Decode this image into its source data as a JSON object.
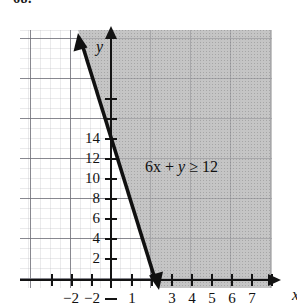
{
  "exercise": {
    "number": "68."
  },
  "chart_data": {
    "type": "line",
    "title": "",
    "subtitle": "",
    "xlabel": "x",
    "ylabel": "y",
    "inequality_label": "6x + y ≥ 12",
    "inequality": "6x + y >= 12",
    "boundary_line": {
      "equation": "y = -6x + 12",
      "slope": -6,
      "intercept": 12,
      "style": "solid",
      "arrows": "both",
      "points": [
        [
          -0.4,
          14.4
        ],
        [
          2.6,
          -3.6
        ]
      ]
    },
    "shaded_region": "right of / above boundary line (6x + y >= 12)",
    "shade_color": "#b9b9b9",
    "line_color": "#101010",
    "grid": true,
    "grid_major_step": 2,
    "grid_minor_step": 0.5,
    "xlim": [
      -3.5,
      9
    ],
    "ylim": [
      -5,
      19
    ],
    "xticks": [
      -3,
      -2,
      -1,
      1,
      2,
      3,
      4,
      5,
      6,
      7,
      8
    ],
    "yticks": [
      -4,
      -2,
      2,
      4,
      6,
      8,
      10,
      12,
      14,
      16,
      18
    ],
    "x_tick_labels": [
      {
        "value": -2,
        "text": "−2"
      },
      {
        "value": 1,
        "text": "1"
      },
      {
        "value": 3,
        "text": "3"
      },
      {
        "value": 4,
        "text": "4"
      },
      {
        "value": 5,
        "text": "5"
      },
      {
        "value": 6,
        "text": "6"
      },
      {
        "value": 7,
        "text": "7"
      }
    ],
    "y_tick_labels": [
      {
        "value": 14,
        "text": "14"
      },
      {
        "value": 12,
        "text": "12"
      },
      {
        "value": 10,
        "text": "10"
      },
      {
        "value": 8,
        "text": "8"
      },
      {
        "value": 6,
        "text": "6"
      },
      {
        "value": 4,
        "text": "4"
      },
      {
        "value": 2,
        "text": "2"
      },
      {
        "value": -2,
        "text": "−2"
      },
      {
        "value": -4,
        "text": "−4"
      }
    ]
  }
}
